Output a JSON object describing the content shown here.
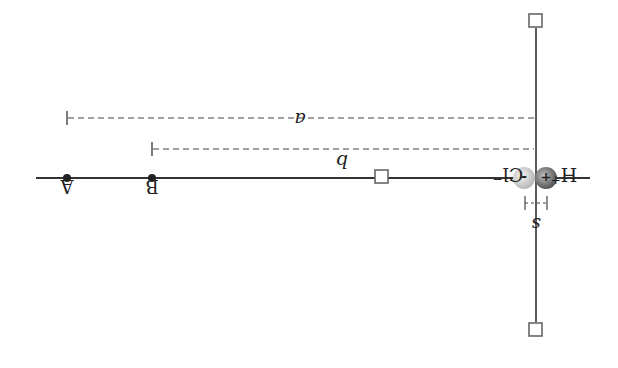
{
  "diagram": {
    "orientation": "rotated 180 degrees",
    "labels": {
      "point_a": "A",
      "point_b": "B",
      "distance_a": "a",
      "distance_b": "b",
      "separation": "s",
      "cation": "H",
      "cation_charge": "+",
      "anion": "Cl",
      "anion_charge": "−",
      "cation_sign": "+",
      "anion_sign": "-"
    },
    "colors": {
      "line": "#333333",
      "dashed": "#444444",
      "handle_fill": "#ffffff",
      "handle_stroke": "#666666",
      "cation_sphere": "#777777",
      "anion_sphere": "#c8c8c8"
    }
  }
}
